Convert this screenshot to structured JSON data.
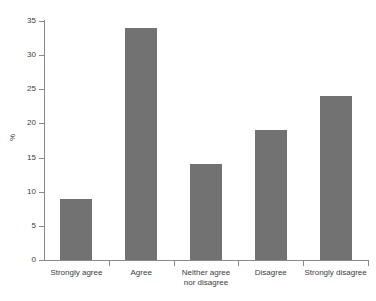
{
  "chart_data": {
    "type": "bar",
    "title": "",
    "xlabel": "",
    "ylabel": "%",
    "categories": [
      "Strongly agree",
      "Agree",
      "Neither agree\nnor disagree",
      "Disagree",
      "Strongly disagree"
    ],
    "values": [
      9,
      34,
      14,
      19,
      24
    ],
    "ylim": [
      0,
      35
    ],
    "yticks": [
      0,
      5,
      10,
      15,
      20,
      25,
      30,
      35
    ],
    "ytick_labels": [
      "0",
      "5",
      "10",
      "15",
      "20",
      "25",
      "30",
      "35"
    ],
    "grid": false,
    "legend": "none",
    "bar_color": "#727272",
    "axis_color": "#8a8a8a",
    "text_color": "#3c3c3c",
    "background": "#ffffff"
  }
}
